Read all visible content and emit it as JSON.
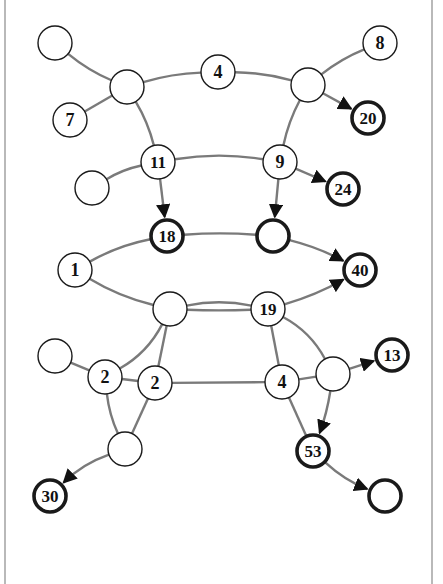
{
  "colors": {
    "background": "#ffffff",
    "edge": "#7a7a7a",
    "arrow": "#111111",
    "node_stroke": "#1a1a1a",
    "node_fill": "#ffffff",
    "frame": "#8a8a8a"
  },
  "nodes": [
    {
      "id": "A",
      "label": "",
      "x": 55,
      "y": 43,
      "bold": false
    },
    {
      "id": "B",
      "label": "",
      "x": 127,
      "y": 87,
      "bold": false
    },
    {
      "id": "C",
      "label": "7",
      "x": 70,
      "y": 120,
      "bold": false
    },
    {
      "id": "D",
      "label": "4",
      "x": 218,
      "y": 72,
      "bold": false
    },
    {
      "id": "E",
      "label": "",
      "x": 308,
      "y": 85,
      "bold": false
    },
    {
      "id": "F",
      "label": "8",
      "x": 380,
      "y": 43,
      "bold": false
    },
    {
      "id": "G",
      "label": "20",
      "x": 368,
      "y": 118,
      "bold": true
    },
    {
      "id": "H",
      "label": "11",
      "x": 158,
      "y": 162,
      "bold": false
    },
    {
      "id": "I",
      "label": "",
      "x": 92,
      "y": 188,
      "bold": false
    },
    {
      "id": "J",
      "label": "9",
      "x": 280,
      "y": 162,
      "bold": false
    },
    {
      "id": "K",
      "label": "24",
      "x": 343,
      "y": 189,
      "bold": true
    },
    {
      "id": "L",
      "label": "18",
      "x": 167,
      "y": 236,
      "bold": true
    },
    {
      "id": "M",
      "label": "",
      "x": 273,
      "y": 236,
      "bold": true
    },
    {
      "id": "N",
      "label": "1",
      "x": 75,
      "y": 270,
      "bold": false
    },
    {
      "id": "O",
      "label": "40",
      "x": 360,
      "y": 270,
      "bold": true
    },
    {
      "id": "P",
      "label": "",
      "x": 170,
      "y": 309,
      "bold": false
    },
    {
      "id": "Q",
      "label": "19",
      "x": 268,
      "y": 309,
      "bold": false
    },
    {
      "id": "R",
      "label": "",
      "x": 55,
      "y": 356,
      "bold": false
    },
    {
      "id": "S",
      "label": "2",
      "x": 105,
      "y": 377,
      "bold": false
    },
    {
      "id": "T",
      "label": "2",
      "x": 155,
      "y": 383,
      "bold": false
    },
    {
      "id": "U",
      "label": "4",
      "x": 282,
      "y": 382,
      "bold": false
    },
    {
      "id": "V",
      "label": "",
      "x": 333,
      "y": 374,
      "bold": false
    },
    {
      "id": "W",
      "label": "13",
      "x": 392,
      "y": 355,
      "bold": true
    },
    {
      "id": "X",
      "label": "",
      "x": 125,
      "y": 449,
      "bold": false
    },
    {
      "id": "Y",
      "label": "30",
      "x": 50,
      "y": 496,
      "bold": true
    },
    {
      "id": "Z",
      "label": "53",
      "x": 313,
      "y": 451,
      "bold": true
    },
    {
      "id": "AA",
      "label": "",
      "x": 385,
      "y": 496,
      "bold": true
    }
  ],
  "edges": [
    {
      "from": "A",
      "to": "B",
      "curve": 6,
      "directed": false
    },
    {
      "from": "C",
      "to": "B",
      "curve": 0,
      "directed": false
    },
    {
      "from": "B",
      "to": "D",
      "curve": -6,
      "directed": false
    },
    {
      "from": "D",
      "to": "E",
      "curve": -6,
      "directed": false
    },
    {
      "from": "E",
      "to": "F",
      "curve": -6,
      "directed": false
    },
    {
      "from": "E",
      "to": "G",
      "curve": 0,
      "directed": true
    },
    {
      "from": "B",
      "to": "H",
      "curve": -6,
      "directed": false
    },
    {
      "from": "E",
      "to": "J",
      "curve": 6,
      "directed": false
    },
    {
      "from": "I",
      "to": "H",
      "curve": -6,
      "directed": false
    },
    {
      "from": "H",
      "to": "J",
      "curve": -10,
      "directed": false
    },
    {
      "from": "J",
      "to": "K",
      "curve": 0,
      "directed": true
    },
    {
      "from": "H",
      "to": "L",
      "curve": 0,
      "directed": true
    },
    {
      "from": "J",
      "to": "M",
      "curve": 0,
      "directed": true
    },
    {
      "from": "N",
      "to": "L",
      "curve": -8,
      "directed": false
    },
    {
      "from": "L",
      "to": "M",
      "curve": -4,
      "directed": false
    },
    {
      "from": "M",
      "to": "O",
      "curve": -6,
      "directed": true
    },
    {
      "from": "N",
      "to": "P",
      "curve": 8,
      "directed": false
    },
    {
      "from": "P",
      "to": "Q",
      "curve": -10,
      "directed": false
    },
    {
      "from": "P",
      "to": "Q",
      "curve": 2,
      "directed": false
    },
    {
      "from": "Q",
      "to": "O",
      "curve": 6,
      "directed": true
    },
    {
      "from": "P",
      "to": "S",
      "curve": -14,
      "directed": false
    },
    {
      "from": "P",
      "to": "T",
      "curve": 0,
      "directed": false
    },
    {
      "from": "Q",
      "to": "U",
      "curve": 0,
      "directed": false
    },
    {
      "from": "Q",
      "to": "V",
      "curve": -14,
      "directed": false
    },
    {
      "from": "R",
      "to": "S",
      "curve": 0,
      "directed": false
    },
    {
      "from": "S",
      "to": "T",
      "curve": 0,
      "directed": false
    },
    {
      "from": "T",
      "to": "U",
      "curve": 0,
      "directed": false
    },
    {
      "from": "U",
      "to": "V",
      "curve": 0,
      "directed": false
    },
    {
      "from": "V",
      "to": "W",
      "curve": 0,
      "directed": true
    },
    {
      "from": "S",
      "to": "X",
      "curve": 6,
      "directed": false
    },
    {
      "from": "T",
      "to": "X",
      "curve": 0,
      "directed": false
    },
    {
      "from": "X",
      "to": "Y",
      "curve": 10,
      "directed": true
    },
    {
      "from": "U",
      "to": "Z",
      "curve": 0,
      "directed": false
    },
    {
      "from": "V",
      "to": "Z",
      "curve": -4,
      "directed": true
    },
    {
      "from": "Z",
      "to": "AA",
      "curve": 8,
      "directed": true
    }
  ],
  "node_radius": 17
}
